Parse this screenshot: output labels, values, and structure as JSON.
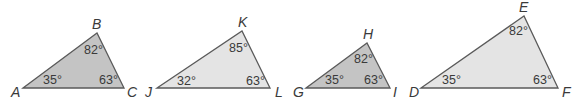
{
  "triangles": [
    {
      "id": "ABC",
      "fill": "#c4c4c4",
      "stroke": "#5a5a5a",
      "vertices": [
        {
          "label": "A",
          "x": 23,
          "y": 88
        },
        {
          "label": "B",
          "x": 97,
          "y": 33
        },
        {
          "label": "C",
          "x": 124,
          "y": 88
        }
      ],
      "angles": [
        {
          "vertex": "A",
          "value": "35°"
        },
        {
          "vertex": "B",
          "value": "82°"
        },
        {
          "vertex": "C",
          "value": "63°"
        }
      ]
    },
    {
      "id": "JKL",
      "fill": "#e4e4e4",
      "stroke": "#5a5a5a",
      "vertices": [
        {
          "label": "J",
          "x": 157,
          "y": 88
        },
        {
          "label": "K",
          "x": 242,
          "y": 31
        },
        {
          "label": "L",
          "x": 270,
          "y": 88
        }
      ],
      "angles": [
        {
          "vertex": "J",
          "value": "32°"
        },
        {
          "vertex": "K",
          "value": "85°"
        },
        {
          "vertex": "L",
          "value": "63°"
        }
      ]
    },
    {
      "id": "GHI",
      "fill": "#c4c4c4",
      "stroke": "#5a5a5a",
      "vertices": [
        {
          "label": "G",
          "x": 306,
          "y": 88
        },
        {
          "label": "H",
          "x": 367,
          "y": 43
        },
        {
          "label": "I",
          "x": 390,
          "y": 88
        }
      ],
      "angles": [
        {
          "vertex": "G",
          "value": "35°"
        },
        {
          "vertex": "H",
          "value": "82°"
        },
        {
          "vertex": "I",
          "value": "63°"
        }
      ]
    },
    {
      "id": "DEF",
      "fill": "#e4e4e4",
      "stroke": "#5a5a5a",
      "vertices": [
        {
          "label": "D",
          "x": 421,
          "y": 88
        },
        {
          "label": "E",
          "x": 524,
          "y": 16
        },
        {
          "label": "F",
          "x": 558,
          "y": 88
        }
      ],
      "angles": [
        {
          "vertex": "D",
          "value": "35°"
        },
        {
          "vertex": "E",
          "value": "82°"
        },
        {
          "vertex": "F",
          "value": "63°"
        }
      ]
    }
  ]
}
